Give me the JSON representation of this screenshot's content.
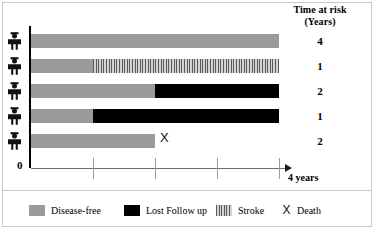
{
  "header": {
    "line1": "Time at risk",
    "line2": "(Years)"
  },
  "axis": {
    "origin_label": "0",
    "end_label": "4 years",
    "ticks": [
      0,
      1,
      2,
      3,
      4
    ],
    "x_min": 0,
    "x_max": 4
  },
  "legend": {
    "items": [
      {
        "key": "disease-free",
        "label": "Disease-free",
        "swatch": "solid-gray",
        "color": "#9a9a9a"
      },
      {
        "key": "lost-follow-up",
        "label": "Lost Follow up",
        "swatch": "solid-black",
        "color": "#000000"
      },
      {
        "key": "stroke",
        "label": "Stroke",
        "swatch": "striped",
        "color": "#bdbdbd"
      },
      {
        "key": "death",
        "label": "Death",
        "swatch": "x-mark",
        "color": "#111111"
      }
    ]
  },
  "chart_data": {
    "type": "bar",
    "title": "",
    "subtitle": "",
    "xlabel": "4 years",
    "ylabel": "",
    "xlim": [
      0,
      4
    ],
    "grid": false,
    "legend_position": "bottom",
    "categories": [
      "Subject 1",
      "Subject 2",
      "Subject 3",
      "Subject 4",
      "Subject 5"
    ],
    "icon": "person-icon",
    "time_at_risk_header": "Time at risk (Years)",
    "subjects": [
      {
        "id": 1,
        "time_at_risk": "4",
        "segments": [
          {
            "type": "disease-free",
            "start": 0,
            "end": 4
          }
        ],
        "death_at": null
      },
      {
        "id": 2,
        "time_at_risk": "1",
        "segments": [
          {
            "type": "disease-free",
            "start": 0,
            "end": 1
          },
          {
            "type": "stroke",
            "start": 1,
            "end": 4
          }
        ],
        "death_at": null
      },
      {
        "id": 3,
        "time_at_risk": "2",
        "segments": [
          {
            "type": "disease-free",
            "start": 0,
            "end": 2
          },
          {
            "type": "lost-follow-up",
            "start": 2,
            "end": 4
          }
        ],
        "death_at": null
      },
      {
        "id": 4,
        "time_at_risk": "1",
        "segments": [
          {
            "type": "disease-free",
            "start": 0,
            "end": 1
          },
          {
            "type": "lost-follow-up",
            "start": 1,
            "end": 4
          }
        ],
        "death_at": null
      },
      {
        "id": 5,
        "time_at_risk": "2",
        "segments": [
          {
            "type": "disease-free",
            "start": 0,
            "end": 2
          }
        ],
        "death_at": 2,
        "death_marker": "X"
      }
    ]
  }
}
